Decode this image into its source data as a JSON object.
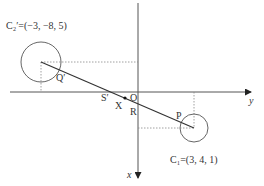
{
  "diagram": {
    "type": "geometry-projection",
    "axes": {
      "horizontal_label": "y",
      "vertical_label": "x",
      "origin_label": "O"
    },
    "circles": [
      {
        "id": "C2prime",
        "label": "C₂′=(−3, −8, 5)",
        "center": [
          41,
          62
        ],
        "radius": 20
      },
      {
        "id": "C1",
        "label": "C₁=(3, 4, 1)",
        "center": [
          194,
          128
        ],
        "radius": 14
      }
    ],
    "points": [
      {
        "label": "Q′"
      },
      {
        "label": "S′"
      },
      {
        "label": "X"
      },
      {
        "label": "R"
      },
      {
        "label": "P"
      }
    ],
    "colors": {
      "line": "#333333",
      "dotted": "#888888",
      "axis": "#555555"
    }
  }
}
